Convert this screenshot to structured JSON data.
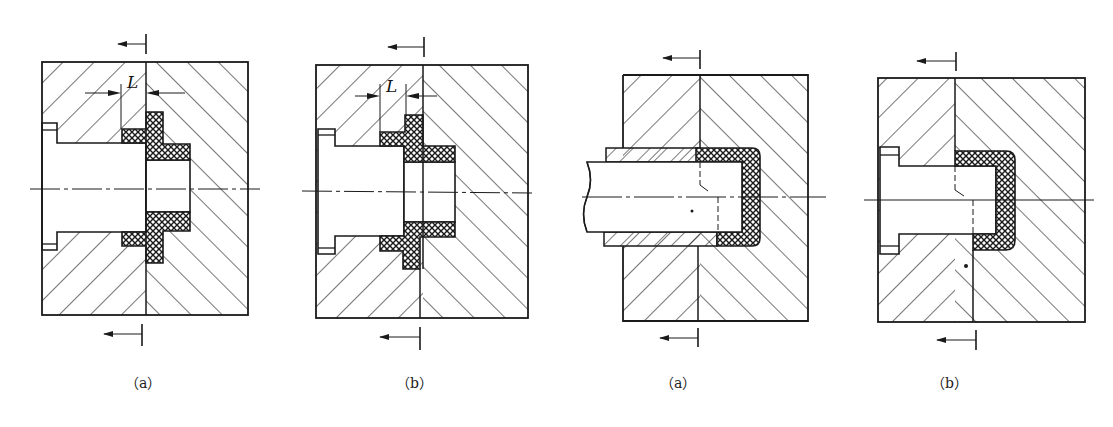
{
  "figure": {
    "panels": [
      {
        "id": "panel-1",
        "label": "（a）",
        "dimension_label": "L",
        "group": "left-pair"
      },
      {
        "id": "panel-2",
        "label": "（b）",
        "dimension_label": "L",
        "group": "left-pair"
      },
      {
        "id": "panel-3",
        "label": "（a）",
        "group": "right-pair"
      },
      {
        "id": "panel-4",
        "label": "（b）",
        "group": "right-pair"
      }
    ]
  },
  "colors": {
    "line": "#1a1a1a",
    "hatch": "#2a2a2a",
    "background": "#ffffff"
  }
}
